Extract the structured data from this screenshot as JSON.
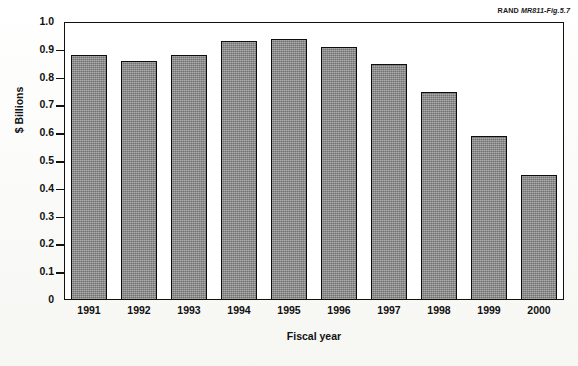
{
  "credit": {
    "org": "RAND",
    "figure": "MR811-Fig.5.7"
  },
  "chart_data": {
    "type": "bar",
    "title": "",
    "xlabel": "Fiscal year",
    "ylabel": "$ Billions",
    "categories": [
      "1991",
      "1992",
      "1993",
      "1994",
      "1995",
      "1996",
      "1997",
      "1998",
      "1999",
      "2000"
    ],
    "values": [
      0.88,
      0.86,
      0.88,
      0.93,
      0.94,
      0.91,
      0.85,
      0.75,
      0.59,
      0.45
    ],
    "ylim": [
      0,
      1.0
    ],
    "ytick_labels": [
      "1.0",
      "0.9",
      "0.8",
      "0.7",
      "0.6",
      "0.5",
      "0.4",
      "0.3",
      "0.2",
      "0.1",
      "0"
    ],
    "ytick_values": [
      1.0,
      0.9,
      0.8,
      0.7,
      0.6,
      0.5,
      0.4,
      0.3,
      0.2,
      0.1,
      0
    ],
    "grid": false,
    "legend": null,
    "bar_color": "#8c8c8c",
    "bar_edge_color": "#0d0d0d",
    "frame_color": "#111111"
  }
}
